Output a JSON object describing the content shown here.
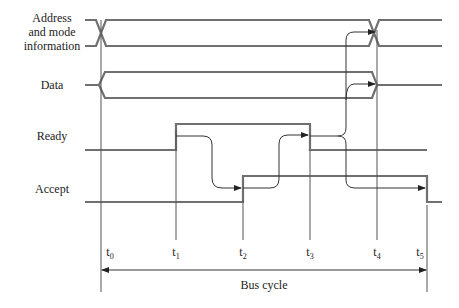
{
  "signals": [
    {
      "name": "Address and mode information",
      "lines": [
        "Address",
        "and mode",
        "information"
      ]
    },
    {
      "name": "Data",
      "lines": [
        "Data"
      ]
    },
    {
      "name": "Ready",
      "lines": [
        "Ready"
      ]
    },
    {
      "name": "Accept",
      "lines": [
        "Accept"
      ]
    }
  ],
  "time_markers": [
    {
      "base": "t",
      "sub": "0"
    },
    {
      "base": "t",
      "sub": "1"
    },
    {
      "base": "t",
      "sub": "2"
    },
    {
      "base": "t",
      "sub": "3"
    },
    {
      "base": "t",
      "sub": "4"
    },
    {
      "base": "t",
      "sub": "5"
    }
  ],
  "bus_cycle_label": "Bus cycle",
  "colors": {
    "signal": "#707070",
    "guide": "#555555",
    "text": "#222222"
  }
}
